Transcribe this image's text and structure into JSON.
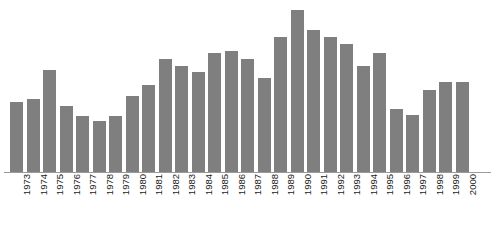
{
  "chart_data": {
    "type": "bar",
    "title": "",
    "subtitle": "",
    "xlabel": "",
    "ylabel": "",
    "legend": [],
    "grid": false,
    "bar_color": "#7f7f7f",
    "axis_color": "#9a9a9a",
    "label_color": "#1a1a1a",
    "ylim": [
      0,
      100
    ],
    "xlim_categories": 28,
    "categories": [
      "1973",
      "1974",
      "1975",
      "1976",
      "1977",
      "1978",
      "1979",
      "1980",
      "1981",
      "1982",
      "1983",
      "1984",
      "1985",
      "1986",
      "1987",
      "1988",
      "1989",
      "1990",
      "1991",
      "1992",
      "1993",
      "1994",
      "1995",
      "1996",
      "1997",
      "1998",
      "1999",
      "2000"
    ],
    "values": [
      41,
      43,
      60,
      39,
      33,
      30,
      33,
      45,
      51,
      66,
      62,
      59,
      70,
      71,
      66,
      55,
      79,
      95,
      83,
      79,
      75,
      62,
      70,
      37,
      34,
      48,
      53,
      53
    ]
  }
}
